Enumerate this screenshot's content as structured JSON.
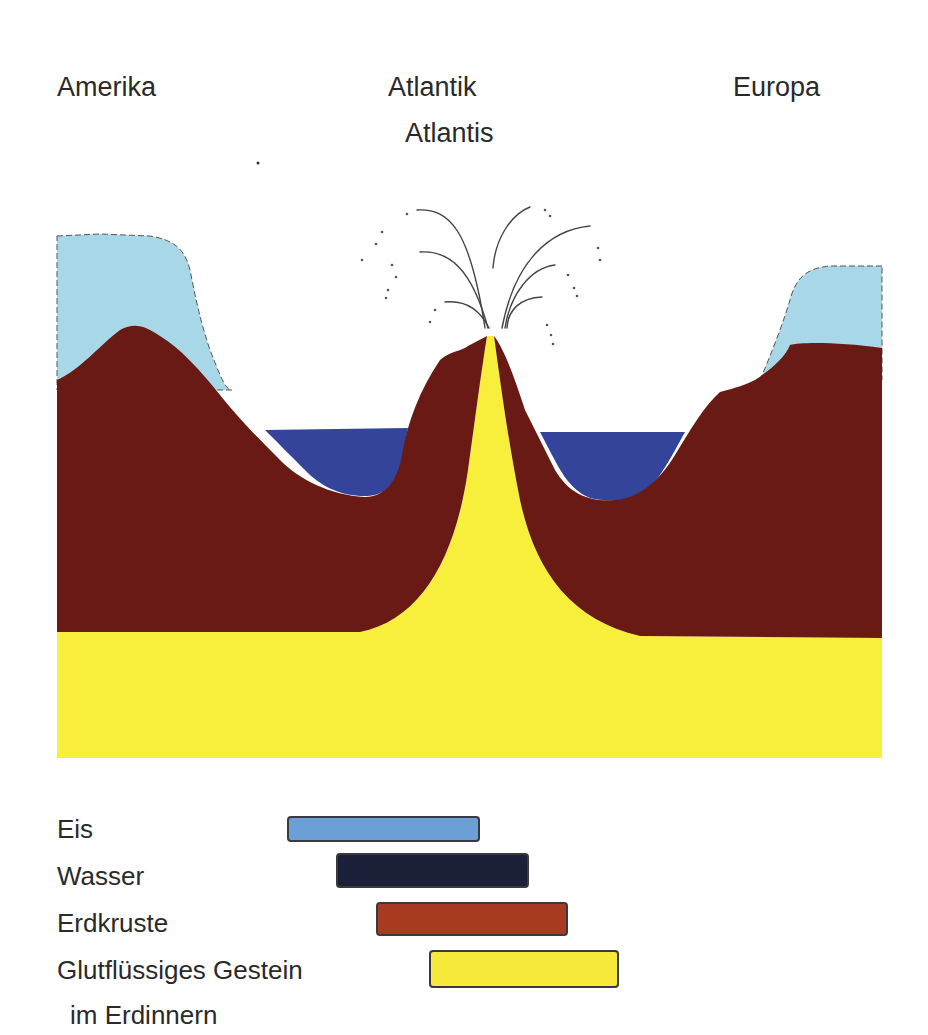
{
  "labels": {
    "left": "Amerika",
    "center_top": "Atlantik",
    "center_bottom": "Atlantis",
    "right": "Europa"
  },
  "legend": {
    "items": [
      {
        "label": "Eis",
        "color": "#6b9fd8"
      },
      {
        "label": "Wasser",
        "color": "#1c1f38"
      },
      {
        "label": "Erdkruste",
        "color": "#a83a22"
      },
      {
        "label": "Glutflüssiges Gestein",
        "label_line2": "im Erdinnern",
        "color": "#f7ea3a"
      }
    ]
  },
  "colors": {
    "ice": "#a8d8e8",
    "water": "#33449a",
    "crust": "#6a1a14",
    "magma": "#f8ee3c"
  }
}
